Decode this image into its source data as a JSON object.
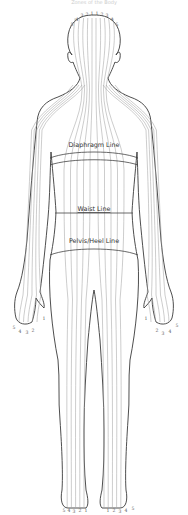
{
  "figure": {
    "title": "Zones of the Body",
    "band_labels": {
      "diaphragm": "Diaphragm Line",
      "waist": "Waist Line",
      "pelvis": "Pelvis/Heel Line"
    },
    "zone_numbers": {
      "head": [
        "5",
        "4",
        "3",
        "2",
        "1",
        "1",
        "2",
        "3",
        "4",
        "5"
      ],
      "left_hand": [
        "5",
        "4",
        "3",
        "2",
        "1"
      ],
      "right_hand": [
        "1",
        "2",
        "3",
        "4",
        "5"
      ],
      "left_foot": [
        "5",
        "4",
        "3",
        "2",
        "1"
      ],
      "right_foot": [
        "1",
        "2",
        "3",
        "4",
        "5"
      ]
    },
    "colors": {
      "outline": "#3a3a3a",
      "zone_lines": "#9a9a9a",
      "text": "#333333"
    }
  }
}
